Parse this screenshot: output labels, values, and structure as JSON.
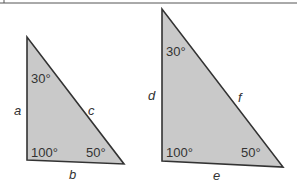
{
  "figure": {
    "fill_color": "#c8c8c8",
    "stroke_color": "#333333",
    "triangles": [
      {
        "name": "triangle-1",
        "angles": {
          "top": "30°",
          "bottom_left": "100°",
          "bottom_right": "50°"
        },
        "sides": {
          "left": "a",
          "bottom": "b",
          "hypotenuse": "c"
        }
      },
      {
        "name": "triangle-2",
        "angles": {
          "top": "30°",
          "bottom_left": "100°",
          "bottom_right": "50°"
        },
        "sides": {
          "left": "d",
          "bottom": "e",
          "hypotenuse": "f"
        }
      }
    ]
  }
}
